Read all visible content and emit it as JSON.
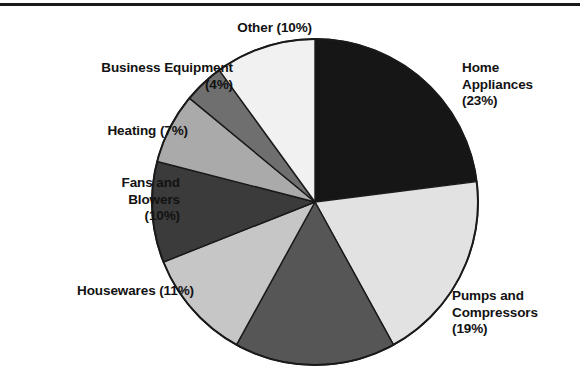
{
  "figure": {
    "background_color": "#ffffff",
    "has_top_rule": true,
    "top_rule_color": "#1a1a1a"
  },
  "labels": {
    "other": "Other (10%)",
    "business_equipment": "Business Equipment\n(4%)",
    "heating": "Heating (7%)",
    "fans_and_blowers": "Fans and\nBlowers\n(10%)",
    "housewares": "Housewares (11%)",
    "home_appliances": "Home\nAppliances\n(23%)",
    "pumps_and_compressors": "Pumps and\nCompressors\n(19%)"
  },
  "chart_data": {
    "type": "pie",
    "title": "",
    "xlabel": "",
    "ylabel": "",
    "start_angle_deg": 0,
    "direction": "clockwise",
    "legend_position": "outside-labels",
    "grid": false,
    "outline_color": "#1a1a1a",
    "categories": [
      "Home Appliances",
      "Pumps and Compressors",
      "Other Motor Applications",
      "Housewares",
      "Fans and Blowers",
      "Heating",
      "Business Equipment",
      "Other"
    ],
    "values": [
      23,
      19,
      16,
      11,
      10,
      7,
      4,
      10
    ],
    "labels": [
      "Home Appliances (23%)",
      "Pumps and Compressors (19%)",
      "",
      "Housewares (11%)",
      "Fans and Blowers (10%)",
      "Heating (7%)",
      "Business Equipment (4%)",
      "Other (10%)"
    ],
    "colors": [
      "#161616",
      "#e2e2e2",
      "#565656",
      "#c6c6c6",
      "#3b3b3b",
      "#aaaaaa",
      "#6f6f6f",
      "#f1f1f1"
    ],
    "unit": "%"
  }
}
